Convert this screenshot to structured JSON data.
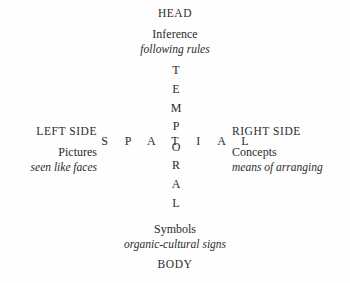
{
  "diagram": {
    "poles": {
      "top": {
        "name": "HEAD",
        "noun": "Inference",
        "gloss": "following rules"
      },
      "bottom": {
        "name": "BODY",
        "noun": "Symbols",
        "gloss": "organic-cultural signs"
      },
      "left": {
        "name": "LEFT SIDE",
        "noun": "Pictures",
        "gloss": "seen like faces"
      },
      "right": {
        "name": "RIGHT SIDE",
        "noun": "Concepts",
        "gloss": "means of arranging"
      }
    },
    "axes": {
      "horizontal": {
        "word": "SPATIAL",
        "letters": [
          "S",
          "P",
          "A",
          "T",
          "I",
          "A",
          "L"
        ]
      },
      "vertical": {
        "word": "TEMPORAL",
        "letters": [
          "T",
          "E",
          "M",
          "P",
          "O",
          "R",
          "A",
          "L"
        ]
      }
    },
    "colors": {
      "text": "#2b2b2b",
      "background": "#fefefe"
    }
  }
}
